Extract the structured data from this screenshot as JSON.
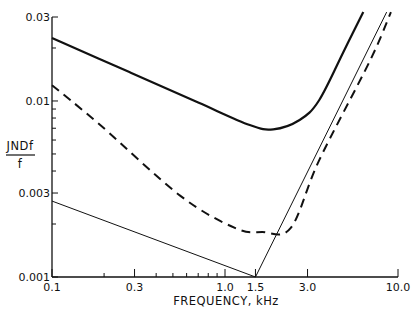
{
  "chart_data": {
    "type": "line",
    "title": "",
    "xlabel": "FREQUENCY, kHz",
    "ylabel": "JNDf / f",
    "ylabel_numerator": "JNDf",
    "ylabel_denominator": "f",
    "xscale": "log",
    "yscale": "log",
    "xlim": [
      0.1,
      10.0
    ],
    "ylim": [
      0.001,
      0.03
    ],
    "grid": false,
    "legend": null,
    "x_ticks": [
      {
        "value": 0.1,
        "label": "0.1"
      },
      {
        "value": 0.3,
        "label": "0.3"
      },
      {
        "value": 1.0,
        "label": "1.0"
      },
      {
        "value": 1.5,
        "label": "1.5"
      },
      {
        "value": 3.0,
        "label": "3.0"
      },
      {
        "value": 10.0,
        "label": "10.0"
      }
    ],
    "x_minor_ticks": [
      0.2,
      0.4,
      0.5,
      0.6,
      0.7,
      0.8,
      0.9
    ],
    "y_ticks": [
      {
        "value": 0.001,
        "label": "0.001"
      },
      {
        "value": 0.003,
        "label": "0.003"
      },
      {
        "value": 0.01,
        "label": "0.01"
      },
      {
        "value": 0.03,
        "label": "0.03"
      }
    ],
    "y_minor_ticks": [
      0.002,
      0.004,
      0.005,
      0.006,
      0.007,
      0.008,
      0.009,
      0.02
    ],
    "series": [
      {
        "name": "solid-thick",
        "style": "solid",
        "stroke_width": 2.2,
        "x": [
          0.1,
          0.28,
          0.7,
          1.39,
          1.9,
          2.7,
          3.5,
          4.9,
          6.3
        ],
        "y": [
          0.0228,
          0.0146,
          0.0098,
          0.0073,
          0.0069,
          0.0078,
          0.0101,
          0.0195,
          0.032
        ]
      },
      {
        "name": "dashed",
        "style": "dashed",
        "stroke_width": 2.0,
        "x": [
          0.1,
          0.19,
          0.55,
          1.14,
          1.64,
          2.4,
          3.5,
          6.9,
          9.1
        ],
        "y": [
          0.0123,
          0.0073,
          0.0029,
          0.0019,
          0.0018,
          0.0019,
          0.0046,
          0.017,
          0.032
        ]
      },
      {
        "name": "thin-straight",
        "style": "solid",
        "stroke_width": 1.0,
        "x": [
          0.1,
          1.5,
          8.6
        ],
        "y": [
          0.0027,
          0.001,
          0.032
        ]
      }
    ]
  }
}
